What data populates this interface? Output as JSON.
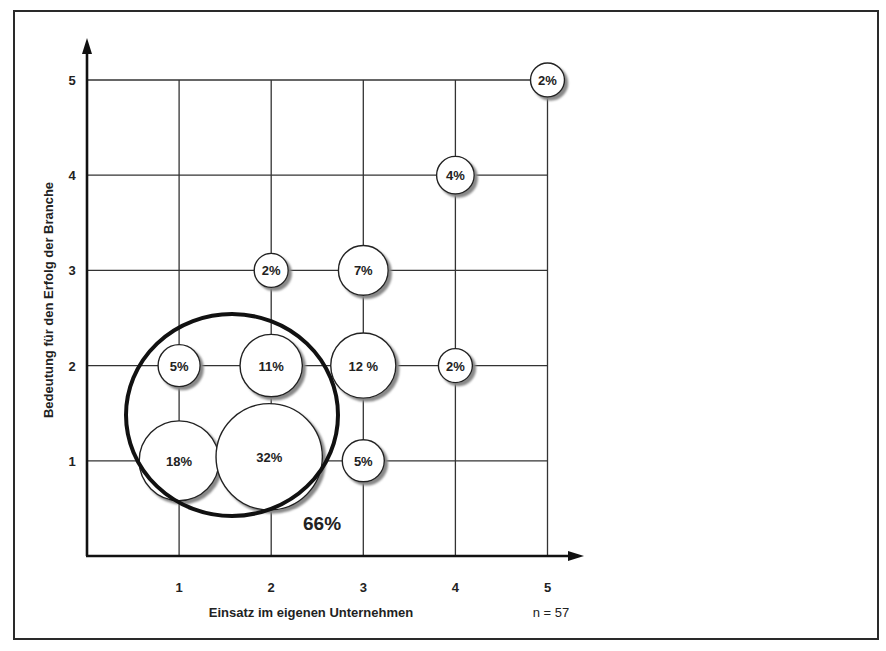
{
  "chart_data": {
    "type": "scatter",
    "subtype": "bubble",
    "title": "",
    "xlabel": "Einsatz im eigenen Unternehmen",
    "ylabel": "Bedeutung für den Erfolg der Branche",
    "x_ticks": [
      "1",
      "2",
      "3",
      "4",
      "5"
    ],
    "y_ticks": [
      "1",
      "2",
      "3",
      "4",
      "5"
    ],
    "xlim": [
      0,
      5
    ],
    "ylim": [
      0,
      5
    ],
    "grid": true,
    "sample_note": "n = 57",
    "points": [
      {
        "x": 1,
        "y": 1,
        "label": "18%",
        "value": 18
      },
      {
        "x": 2,
        "y": 1,
        "label": "32%",
        "value": 32
      },
      {
        "x": 3,
        "y": 1,
        "label": "5%",
        "value": 5
      },
      {
        "x": 1,
        "y": 2,
        "label": "5%",
        "value": 5
      },
      {
        "x": 2,
        "y": 2,
        "label": "11%",
        "value": 11
      },
      {
        "x": 3,
        "y": 2,
        "label": "12 %",
        "value": 12
      },
      {
        "x": 4,
        "y": 2,
        "label": "2%",
        "value": 2
      },
      {
        "x": 2,
        "y": 3,
        "label": "2%",
        "value": 2
      },
      {
        "x": 3,
        "y": 3,
        "label": "7%",
        "value": 7
      },
      {
        "x": 4,
        "y": 4,
        "label": "4%",
        "value": 4
      },
      {
        "x": 5,
        "y": 5,
        "label": "2%",
        "value": 2
      }
    ],
    "annotations": [
      {
        "type": "ellipse",
        "encloses": [
          "1,1",
          "2,1",
          "1,2",
          "2,2"
        ],
        "label": "66%"
      }
    ]
  }
}
